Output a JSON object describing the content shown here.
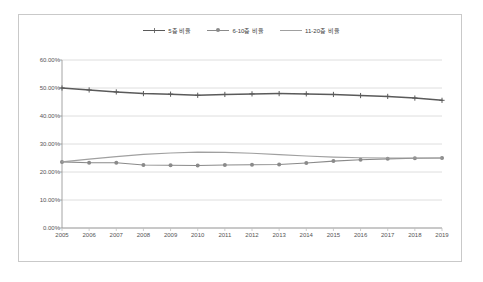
{
  "chart_data": {
    "type": "line",
    "title": "",
    "xlabel": "",
    "ylabel": "",
    "categories": [
      "2005",
      "2006",
      "2007",
      "2008",
      "2009",
      "2010",
      "2011",
      "2012",
      "2013",
      "2014",
      "2015",
      "2016",
      "2017",
      "2018",
      "2019"
    ],
    "ylim": [
      0,
      60
    ],
    "ytick_labels": [
      "0.00%",
      "10.00%",
      "20.00%",
      "30.00%",
      "40.00%",
      "50.00%",
      "60.00%"
    ],
    "ytick_values": [
      0,
      10,
      20,
      30,
      40,
      50,
      60
    ],
    "grid": true,
    "legend_position": "top-center",
    "series": [
      {
        "name": "5층 비율",
        "color": "#5a5a5a",
        "marker": "cross",
        "values": [
          50.0,
          49.3,
          48.6,
          48.0,
          47.8,
          47.4,
          47.7,
          47.9,
          48.0,
          47.9,
          47.7,
          47.3,
          47.0,
          46.4,
          45.6
        ]
      },
      {
        "name": "6-10층 비율",
        "color": "#8a8a8a",
        "marker": "circle",
        "values": [
          23.6,
          23.3,
          23.3,
          22.5,
          22.4,
          22.3,
          22.5,
          22.6,
          22.7,
          23.2,
          23.9,
          24.4,
          24.7,
          24.9,
          25.0
        ]
      },
      {
        "name": "11-20층 비율",
        "color": "#a0a0a0",
        "marker": "none",
        "values": [
          23.6,
          24.6,
          25.5,
          26.3,
          26.8,
          27.1,
          27.0,
          26.7,
          26.2,
          25.7,
          25.3,
          25.1,
          25.0,
          25.0,
          25.0
        ]
      }
    ]
  },
  "legend": {
    "items": [
      {
        "label": "5층 비율"
      },
      {
        "label": "6-10층 비율"
      },
      {
        "label": "11-20층 비율"
      }
    ]
  }
}
